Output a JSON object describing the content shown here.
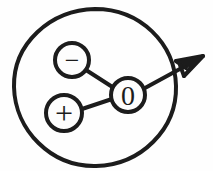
{
  "figure": {
    "name": "dipole-molecule-diagram",
    "background_color": "#fefefe",
    "ink_color": "#1c1c1c",
    "width": 213,
    "height": 171
  },
  "outer_boundary": {
    "label": "",
    "shape": "circle",
    "cx": 95,
    "cy": 87,
    "rx": 81,
    "ry": 78,
    "stroke_width": 4
  },
  "nodes": [
    {
      "id": "negative-node",
      "symbol": "−",
      "cx": 72,
      "cy": 60,
      "r": 17,
      "stroke_width": 4,
      "font_size": 26
    },
    {
      "id": "positive-node",
      "symbol": "+",
      "cx": 64,
      "cy": 113,
      "r": 18,
      "stroke_width": 4,
      "font_size": 30
    },
    {
      "id": "center-node",
      "symbol": "0",
      "cx": 128,
      "cy": 95,
      "r": 17,
      "stroke_width": 4,
      "font_size": 28
    }
  ],
  "bonds": [
    {
      "id": "bond-negative-center",
      "from": "negative-node",
      "to": "center-node",
      "x1": 86,
      "y1": 70,
      "x2": 114,
      "y2": 88,
      "stroke_width": 4
    },
    {
      "id": "bond-positive-center",
      "from": "positive-node",
      "to": "center-node",
      "x1": 82,
      "y1": 109,
      "x2": 112,
      "y2": 99,
      "stroke_width": 4
    }
  ],
  "arrow": {
    "id": "dipole-moment-arrow",
    "label": "",
    "x1": 145,
    "y1": 88,
    "x2": 203,
    "y2": 56,
    "stroke_width": 4,
    "head_points": "203,56 178,60 190,66 172,78 186,76 181,86",
    "direction": "up-right"
  },
  "accessibility": {
    "description": "Hand drawn diagram: a large circle contains a negative charge node, a positive charge node and a central node labeled 0, joined by two bonds, with an arrow pointing up and to the right out of the circle."
  }
}
